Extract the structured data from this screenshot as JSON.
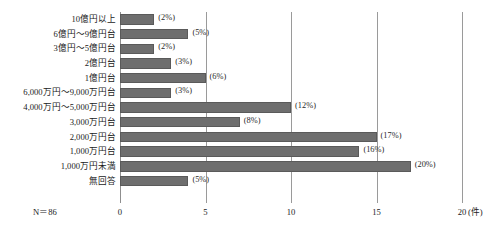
{
  "chart_data": {
    "type": "bar",
    "orientation": "horizontal",
    "title": "",
    "subtitle": "",
    "xlabel": "",
    "ylabel": "",
    "xlim": [
      0,
      20
    ],
    "x_unit_label": "(件)",
    "x_ticks": [
      "0",
      "5",
      "10",
      "15",
      "20"
    ],
    "x_tick_values": [
      0,
      5,
      10,
      15,
      20
    ],
    "grid": true,
    "grid_axis": "x",
    "legend": "none",
    "sample_note": "N＝86",
    "bar_color": "#6e6e6e",
    "categories": [
      "10億円以上",
      "6億円～9億円台",
      "3億円～5億円台",
      "2億円台",
      "1億円台",
      "6,000万円～9,000万円台",
      "4,000万円～5,000万円台",
      "3,000万円台",
      "2,000万円台",
      "1,000万円台",
      "1,000万円未満",
      "無回答"
    ],
    "values": [
      2,
      4,
      2,
      3,
      5,
      3,
      10,
      7,
      15,
      14,
      17,
      4
    ],
    "data_labels": [
      "(2%)",
      "(5%)",
      "(2%)",
      "(3%)",
      "(6%)",
      "(3%)",
      "(12%)",
      "(8%)",
      "(17%)",
      "(16%)",
      "(20%)",
      "(5%)"
    ]
  }
}
